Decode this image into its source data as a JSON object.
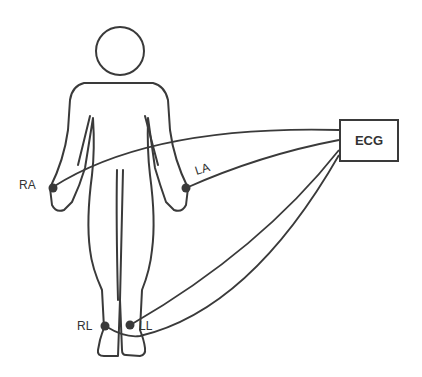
{
  "diagram": {
    "device": {
      "label": "ECG"
    },
    "electrodes": [
      {
        "id": "RA",
        "label": "RA",
        "location": "right wrist"
      },
      {
        "id": "LA",
        "label": "LA",
        "location": "left wrist"
      },
      {
        "id": "RL",
        "label": "RL",
        "location": "right ankle"
      },
      {
        "id": "LL",
        "label": "LL",
        "location": "left ankle"
      }
    ],
    "colors": {
      "stroke": "#3a3a3a",
      "background": "#ffffff"
    }
  }
}
